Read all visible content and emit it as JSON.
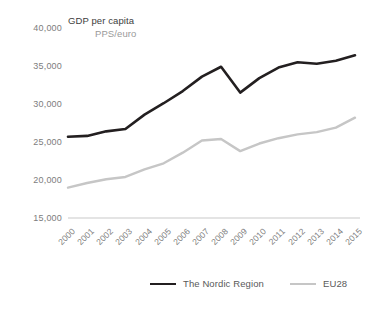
{
  "chart_data": {
    "type": "line",
    "title": "GDP per capita",
    "subtitle": "PPS/euro",
    "xlabel": "",
    "ylabel": "",
    "ylim": [
      15000,
      40000
    ],
    "yticks": [
      "15,000",
      "20,000",
      "25,000",
      "30,000",
      "35,000",
      "40,000"
    ],
    "ytick_values": [
      15000,
      20000,
      25000,
      30000,
      35000,
      40000
    ],
    "grid": false,
    "legend_position": "bottom",
    "categories": [
      "2000",
      "2001",
      "2002",
      "2003",
      "2004",
      "2005",
      "2006",
      "2007",
      "2008",
      "2009",
      "2010",
      "2011",
      "2012",
      "2013",
      "2014",
      "2015"
    ],
    "series": [
      {
        "name": "The Nordic Region",
        "color": "#231f20",
        "values": [
          25700,
          25800,
          26400,
          26700,
          28600,
          30100,
          31700,
          33600,
          34900,
          31500,
          33400,
          34800,
          35500,
          35300,
          35700,
          36400
        ]
      },
      {
        "name": "EU28",
        "color": "#c6c6c6",
        "values": [
          19000,
          19600,
          20100,
          20400,
          21400,
          22200,
          23600,
          25200,
          25400,
          23800,
          24800,
          25500,
          26000,
          26300,
          26900,
          28200
        ]
      }
    ]
  },
  "legend": {
    "items": [
      {
        "label": "The Nordic Region"
      },
      {
        "label": "EU28"
      }
    ]
  },
  "colors": {
    "background": "#ffffff",
    "nordic_line": "#231f20",
    "eu28_line": "#c6c6c6",
    "axis_line": "#c9c9c9",
    "tick_text": "#7d7d7d",
    "title_text": "#3d3d3d",
    "subtitle_text": "#9a9a9a",
    "legend_text": "#595959"
  }
}
